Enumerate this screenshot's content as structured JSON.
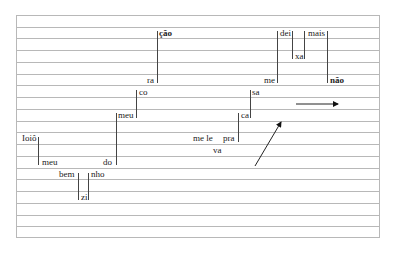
{
  "diagram": {
    "type": "melodic-contour-staff",
    "staff": {
      "left": 16,
      "top": 15,
      "width": 364,
      "height": 223,
      "rows": 19,
      "line_color": "#b8b8b8"
    },
    "words": [
      {
        "text": "ção",
        "x": 159,
        "y": 29,
        "bold": true
      },
      {
        "text": "ra",
        "x": 147,
        "y": 76,
        "bold": false
      },
      {
        "text": "co",
        "x": 139,
        "y": 88,
        "bold": false
      },
      {
        "text": "meu",
        "x": 118,
        "y": 111,
        "bold": false
      },
      {
        "text": "Ioiô",
        "x": 22,
        "y": 134,
        "bold": false
      },
      {
        "text": "meu",
        "x": 42,
        "y": 158,
        "bold": false
      },
      {
        "text": "do",
        "x": 103,
        "y": 158,
        "bold": false
      },
      {
        "text": "bem",
        "x": 59,
        "y": 170,
        "bold": false
      },
      {
        "text": "nho",
        "x": 91,
        "y": 170,
        "bold": false
      },
      {
        "text": "zi",
        "x": 81,
        "y": 193,
        "bold": false
      },
      {
        "text": "sa",
        "x": 252,
        "y": 88,
        "bold": false
      },
      {
        "text": "ca",
        "x": 241,
        "y": 111,
        "bold": false
      },
      {
        "text": "me le",
        "x": 193,
        "y": 134,
        "bold": false
      },
      {
        "text": "pra",
        "x": 223,
        "y": 134,
        "bold": false
      },
      {
        "text": "va",
        "x": 213,
        "y": 146,
        "bold": false
      },
      {
        "text": "dei",
        "x": 280,
        "y": 29,
        "bold": false
      },
      {
        "text": "xa",
        "x": 295,
        "y": 52,
        "bold": false
      },
      {
        "text": "mais",
        "x": 308,
        "y": 29,
        "bold": false
      },
      {
        "text": "me",
        "x": 264,
        "y": 76,
        "bold": false
      },
      {
        "text": "não",
        "x": 330,
        "y": 76,
        "bold": true
      }
    ],
    "connectors": [
      {
        "x": 157,
        "y1": 31,
        "y2": 83
      },
      {
        "x": 136,
        "y1": 90,
        "y2": 118
      },
      {
        "x": 116,
        "y1": 113,
        "y2": 165
      },
      {
        "x": 38,
        "y1": 137,
        "y2": 165
      },
      {
        "x": 78,
        "y1": 173,
        "y2": 200
      },
      {
        "x": 88,
        "y1": 173,
        "y2": 200
      },
      {
        "x": 250,
        "y1": 90,
        "y2": 118
      },
      {
        "x": 238,
        "y1": 113,
        "y2": 142
      },
      {
        "x": 277,
        "y1": 31,
        "y2": 83
      },
      {
        "x": 292,
        "y1": 31,
        "y2": 59
      },
      {
        "x": 304,
        "y1": 31,
        "y2": 59
      },
      {
        "x": 327,
        "y1": 31,
        "y2": 83
      }
    ],
    "arrows": [
      {
        "name": "horizontal-arrow",
        "x1": 296,
        "y1": 104,
        "x2": 338,
        "y2": 104
      },
      {
        "name": "diagonal-arrow",
        "x1": 255,
        "y1": 166,
        "x2": 281,
        "y2": 122
      }
    ]
  }
}
